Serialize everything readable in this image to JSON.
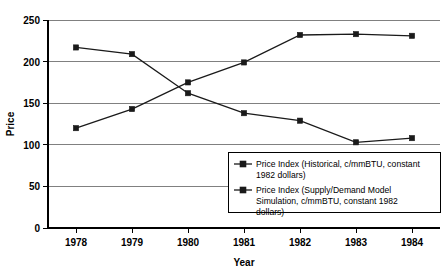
{
  "chart_data": {
    "type": "line",
    "title": "",
    "xlabel": "Year",
    "ylabel": "Price",
    "categories": [
      "1978",
      "1979",
      "1980",
      "1981",
      "1982",
      "1983",
      "1984"
    ],
    "x": [
      1978,
      1979,
      1980,
      1981,
      1982,
      1983,
      1984
    ],
    "ylim": [
      0,
      250
    ],
    "yticks": [
      0,
      50,
      100,
      150,
      200,
      250
    ],
    "ytick_labels": [
      "0",
      "50",
      "100",
      "150",
      "200",
      "250"
    ],
    "grid": true,
    "grid_axis": "y",
    "legend_position": "lower-right-inside",
    "marker": "square",
    "series": [
      {
        "name": "Price Index (Historical, c/mmBTU, constant 1982 dollars)",
        "values": [
          217,
          209,
          162,
          138,
          129,
          103,
          108
        ]
      },
      {
        "name": "Price Index (Supply/Demand Model Simulation, c/mmBTU, constant 1982 dollars)",
        "values": [
          120,
          143,
          175,
          199,
          232,
          233,
          231
        ]
      }
    ]
  },
  "axes": {
    "y_title": "Price",
    "x_title": "Year",
    "y_tick_0": "0",
    "y_tick_1": "50",
    "y_tick_2": "100",
    "y_tick_3": "150",
    "y_tick_4": "200",
    "y_tick_5": "250",
    "x_tick_0": "1978",
    "x_tick_1": "1979",
    "x_tick_2": "1980",
    "x_tick_3": "1981",
    "x_tick_4": "1982",
    "x_tick_5": "1983",
    "x_tick_6": "1984"
  },
  "legend": {
    "entries": [
      {
        "line1": "Price Index (Historical, c/mmBTU, constant",
        "line2": "1982 dollars)"
      },
      {
        "line1": "Price Index (Supply/Demand Model",
        "line2": "Simulation, c/mmBTU, constant 1982",
        "line3": "dollars)"
      }
    ]
  },
  "colors": {
    "series_line": "#1a1a1a",
    "gridline": "#808080",
    "axis": "#000000",
    "background": "#ffffff"
  }
}
